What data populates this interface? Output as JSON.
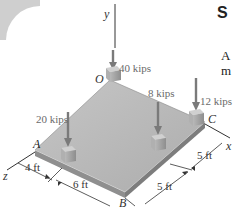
{
  "figure": {
    "axes": {
      "y": "y",
      "x": "x",
      "z": "z"
    },
    "points": {
      "O": "O",
      "A": "A",
      "B": "B",
      "C": "C"
    },
    "loads": [
      {
        "id": "load-40",
        "label": "40 kips"
      },
      {
        "id": "load-20",
        "label": "20 kips"
      },
      {
        "id": "load-8",
        "label": "8 kips"
      },
      {
        "id": "load-12",
        "label": "12 kips"
      }
    ],
    "dimensions": {
      "d1": "4 ft",
      "d2": "6 ft",
      "d3": "5 ft",
      "d4": "5 ft"
    },
    "colors": {
      "plate_top": "#b9b9b9",
      "plate_edge": "#8d8d8d",
      "arrow": "#7a7a7a",
      "block": "#a9a9a9"
    }
  },
  "text": {
    "title_fragment": "S",
    "line1_fragment": "A",
    "line2_fragment": "m"
  }
}
